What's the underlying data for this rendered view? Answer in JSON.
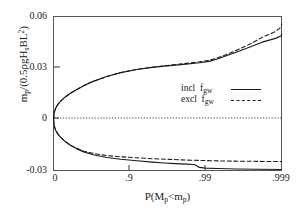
{
  "chart_data": {
    "type": "line",
    "title": "",
    "xlabel": "P(Mp<mp)",
    "ylabel": "mp/(0.5ρgHsBL²)",
    "xlabel_parts": {
      "pre": "P(M",
      "sub1": "p",
      "mid": "<m",
      "sub2": "p",
      "post": ")"
    },
    "ylabel_parts": {
      "pre": "m",
      "sub1": "p",
      "mid": "/(0.5ρgH",
      "sub2": "s",
      "post": "BL",
      "sup": "2",
      "close": ")"
    },
    "xticks": [
      "0",
      ".9",
      ".99",
      ".999"
    ],
    "xtick_values": [
      0,
      0.9,
      0.99,
      0.999
    ],
    "yticks": [
      "0.06",
      "0.03",
      "0",
      "-0.03"
    ],
    "ytick_values": [
      0.06,
      0.03,
      0,
      -0.03
    ],
    "ylim": [
      -0.03,
      0.06
    ],
    "xlim_gumbel": [
      0,
      0.999
    ],
    "grid": false,
    "zero_line": "dotted",
    "legend_position": "center-right",
    "legend": [
      {
        "label_pre": "incl  f",
        "label_sub": "gw",
        "style": "solid"
      },
      {
        "label_pre": "excl  f",
        "label_sub": "gw",
        "style": "dashed"
      }
    ],
    "series": [
      {
        "name": "incl fgw upper",
        "style": "solid",
        "branch": "upper",
        "points": [
          [
            0.0,
            0.0
          ],
          [
            0.02,
            0.0038
          ],
          [
            0.06,
            0.0063
          ],
          [
            0.12,
            0.0085
          ],
          [
            0.2,
            0.0107
          ],
          [
            0.3,
            0.013
          ],
          [
            0.4,
            0.0151
          ],
          [
            0.5,
            0.0172
          ],
          [
            0.6,
            0.0196
          ],
          [
            0.7,
            0.0221
          ],
          [
            0.8,
            0.0249
          ],
          [
            0.87,
            0.0272
          ],
          [
            0.92,
            0.029
          ],
          [
            0.95,
            0.0303
          ],
          [
            0.965,
            0.031
          ],
          [
            0.975,
            0.0316
          ],
          [
            0.982,
            0.0322
          ],
          [
            0.988,
            0.033
          ],
          [
            0.991,
            0.0338
          ],
          [
            0.993,
            0.0352
          ],
          [
            0.995,
            0.0375
          ],
          [
            0.9965,
            0.04
          ],
          [
            0.9975,
            0.0425
          ],
          [
            0.9982,
            0.045
          ],
          [
            0.9988,
            0.0472
          ],
          [
            0.9992,
            0.0487
          ],
          [
            0.9995,
            0.0497
          ]
        ]
      },
      {
        "name": "excl fgw upper",
        "style": "dashed",
        "branch": "upper",
        "points": [
          [
            0.0,
            0.0
          ],
          [
            0.02,
            0.0038
          ],
          [
            0.06,
            0.0063
          ],
          [
            0.12,
            0.0085
          ],
          [
            0.2,
            0.0107
          ],
          [
            0.3,
            0.013
          ],
          [
            0.4,
            0.0151
          ],
          [
            0.5,
            0.0172
          ],
          [
            0.6,
            0.0196
          ],
          [
            0.7,
            0.0221
          ],
          [
            0.8,
            0.0249
          ],
          [
            0.87,
            0.0273
          ],
          [
            0.92,
            0.0291
          ],
          [
            0.95,
            0.0304
          ],
          [
            0.965,
            0.0312
          ],
          [
            0.975,
            0.0319
          ],
          [
            0.982,
            0.0326
          ],
          [
            0.988,
            0.0335
          ],
          [
            0.991,
            0.0344
          ],
          [
            0.993,
            0.0358
          ],
          [
            0.995,
            0.0382
          ],
          [
            0.9965,
            0.0412
          ],
          [
            0.9975,
            0.0443
          ],
          [
            0.9982,
            0.0478
          ],
          [
            0.9988,
            0.0512
          ],
          [
            0.9992,
            0.054
          ],
          [
            0.9994,
            0.0556
          ]
        ]
      },
      {
        "name": "incl fgw lower",
        "style": "solid",
        "branch": "lower",
        "points": [
          [
            0.0,
            0.0
          ],
          [
            0.02,
            -0.0038
          ],
          [
            0.06,
            -0.0063
          ],
          [
            0.12,
            -0.0086
          ],
          [
            0.2,
            -0.0108
          ],
          [
            0.3,
            -0.0131
          ],
          [
            0.4,
            -0.0152
          ],
          [
            0.5,
            -0.0172
          ],
          [
            0.6,
            -0.0191
          ],
          [
            0.7,
            -0.0208
          ],
          [
            0.8,
            -0.0224
          ],
          [
            0.87,
            -0.0234
          ],
          [
            0.92,
            -0.0243
          ],
          [
            0.95,
            -0.0251
          ],
          [
            0.965,
            -0.0256
          ],
          [
            0.975,
            -0.026
          ],
          [
            0.982,
            -0.0263
          ],
          [
            0.986,
            -0.0265
          ],
          [
            0.988,
            -0.0282
          ],
          [
            0.99,
            -0.0286
          ],
          [
            0.993,
            -0.0288
          ],
          [
            0.996,
            -0.0291
          ],
          [
            0.9995,
            -0.0294
          ]
        ]
      },
      {
        "name": "excl fgw lower",
        "style": "dashed",
        "branch": "lower",
        "points": [
          [
            0.0,
            0.0
          ],
          [
            0.02,
            -0.0038
          ],
          [
            0.06,
            -0.0063
          ],
          [
            0.12,
            -0.0086
          ],
          [
            0.2,
            -0.0108
          ],
          [
            0.3,
            -0.0131
          ],
          [
            0.4,
            -0.0152
          ],
          [
            0.5,
            -0.017
          ],
          [
            0.6,
            -0.0187
          ],
          [
            0.7,
            -0.02
          ],
          [
            0.8,
            -0.0213
          ],
          [
            0.87,
            -0.022
          ],
          [
            0.92,
            -0.0226
          ],
          [
            0.95,
            -0.0231
          ],
          [
            0.97,
            -0.0235
          ],
          [
            0.982,
            -0.0239
          ],
          [
            0.99,
            -0.0242
          ],
          [
            0.995,
            -0.0245
          ],
          [
            0.9995,
            -0.0248
          ]
        ]
      }
    ]
  },
  "axes": {
    "x_ticks": [
      {
        "label": "0"
      },
      {
        "label": ".9"
      },
      {
        "label": ".99"
      },
      {
        "label": ".999"
      }
    ],
    "y_ticks": [
      {
        "label": "0.06"
      },
      {
        "label": "0.03"
      },
      {
        "label": "0"
      },
      {
        "label": "-0.03"
      }
    ]
  },
  "legend": {
    "row1_text": "incl",
    "row1_sym_pre": "f",
    "row1_sym_sub": "gw",
    "row2_text": "excl",
    "row2_sym_pre": "f",
    "row2_sym_sub": "gw"
  },
  "colors": {
    "line": "#1a1a1a",
    "axis": "#444444",
    "background": "#ffffff"
  }
}
